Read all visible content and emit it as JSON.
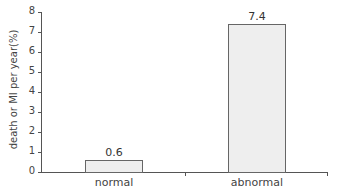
{
  "chart_data": {
    "type": "bar",
    "title": "",
    "xlabel": "",
    "ylabel": "death or MI per year(%)",
    "categories": [
      "normal",
      "abnormal"
    ],
    "values": [
      0.6,
      7.4
    ],
    "value_labels": [
      "0.6",
      "7.4"
    ],
    "ylim": [
      0,
      8
    ],
    "yticks": [
      "0",
      "1",
      "2",
      "3",
      "4",
      "5",
      "6",
      "7",
      "8"
    ],
    "grid": false,
    "legend": null,
    "bar_color": "#eeeeee",
    "bar_edge_color": "#666666"
  }
}
